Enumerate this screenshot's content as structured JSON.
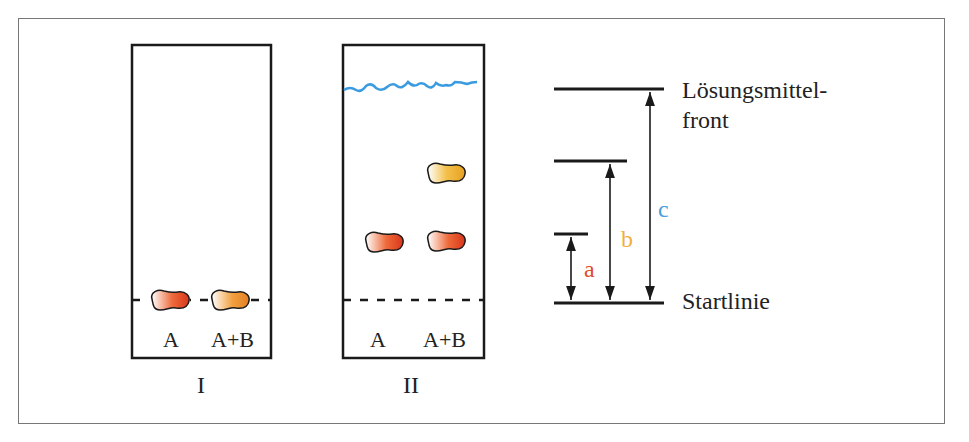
{
  "diagram": {
    "plates": [
      {
        "id": "I",
        "label": "I",
        "lanes": [
          "A",
          "A+B"
        ],
        "state": "Start: Proben auf Startlinie aufgetragen"
      },
      {
        "id": "II",
        "label": "II",
        "lanes": [
          "A",
          "A+B"
        ],
        "state": "Nach Entwicklung: Lösungsmittelfront oben, Substanzen getrennt"
      }
    ],
    "measure": {
      "front_label_line1": "Lösungsmittel-",
      "front_label_line2": "front",
      "start_label": "Startlinie",
      "a": "a",
      "b": "b",
      "c": "c"
    },
    "colors": {
      "spot_A": "#e04a1e",
      "spot_B": "#f0a830",
      "solvent_front": "#3a9be0",
      "label_a": "#e04a2a",
      "label_b": "#f0b040",
      "label_c": "#4aa0e0",
      "ink": "#1a1a1a"
    }
  }
}
